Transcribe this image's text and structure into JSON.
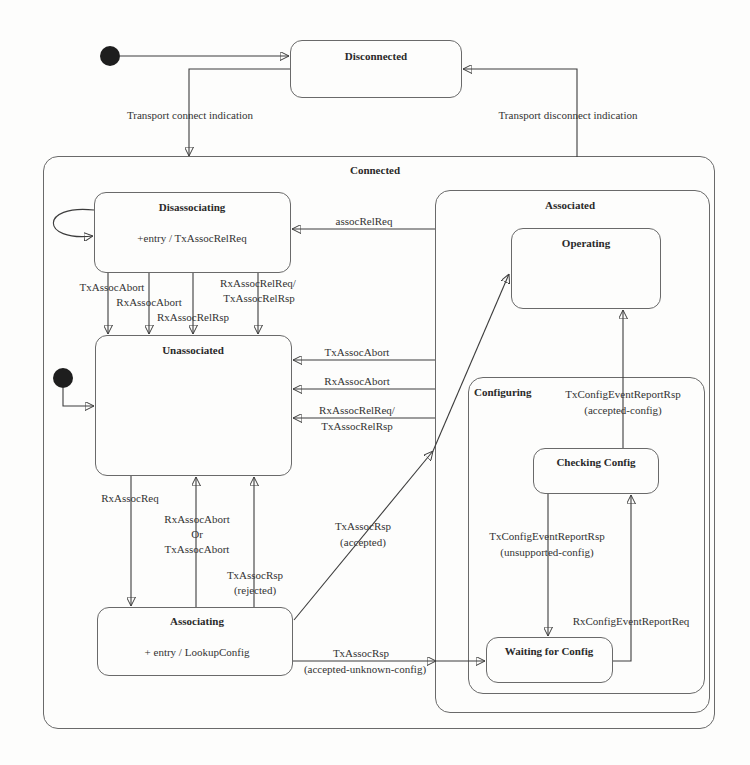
{
  "diagram": {
    "states": {
      "disconnected": {
        "title": "Disconnected"
      },
      "connected": {
        "title": "Connected"
      },
      "disassociating": {
        "title": "Disassociating",
        "action": "+entry / TxAssocRelReq"
      },
      "unassociated": {
        "title": "Unassociated"
      },
      "associating": {
        "title": "Associating",
        "action": "+ entry / LookupConfig"
      },
      "associated": {
        "title": "Associated"
      },
      "operating": {
        "title": "Operating"
      },
      "configuring": {
        "title": "Configuring"
      },
      "checking_config": {
        "title": "Checking Config"
      },
      "waiting_for_config": {
        "title": "Waiting for Config"
      }
    },
    "transitions": {
      "transport_connect": "Transport connect indication",
      "transport_disconnect": "Transport disconnect indication",
      "assoc_rel_req": "assocRelReq",
      "dis_tx_abort": "TxAssocAbort",
      "dis_rx_abort": "RxAssocAbort",
      "dis_rx_rel_rsp": "RxAssocRelRsp",
      "dis_rel_req_line1": "RxAssocRelReq/",
      "dis_rel_req_line2": "TxAssocRelRsp",
      "assoc_tx_abort": "TxAssocAbort",
      "assoc_rx_abort": "RxAssocAbort",
      "assoc_rel_req_line1": "RxAssocRelReq/",
      "assoc_rel_req_line2": "TxAssocRelRsp",
      "rx_assoc_req": "RxAssocReq",
      "abort_line1": "RxAssocAbort",
      "abort_line2": "Or",
      "abort_line3": "TxAssocAbort",
      "rejected_line1": "TxAssocRsp",
      "rejected_line2": "(rejected)",
      "accepted_line1": "TxAssocRsp",
      "accepted_line2": "(accepted)",
      "unknown_config_line1": "TxAssocRsp",
      "unknown_config_line2": "(accepted-unknown-config)",
      "accepted_config_line1": "TxConfigEventReportRsp",
      "accepted_config_line2": "(accepted-config)",
      "unsupported_config_line1": "TxConfigEventReportRsp",
      "unsupported_config_line2": "(unsupported-config)",
      "rx_config_event_report_req": "RxConfigEventReportReq"
    }
  }
}
